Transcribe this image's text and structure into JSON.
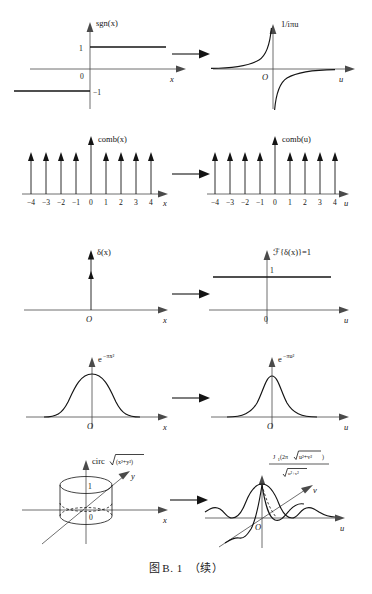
{
  "figure": {
    "caption_prefix": "图",
    "caption_number": "B. 1",
    "caption_suffix": "（续）",
    "caption_full": "图 B. 1 （续）",
    "transform_arrow": "→",
    "ink_color": "#141414",
    "axis_color": "#4a4a4a",
    "background": "#ffffff"
  },
  "rows": [
    {
      "id": "sgn",
      "left": {
        "function_label": "sgn(x)",
        "axis_x": "x",
        "origin_label": "0",
        "value_top": "1",
        "value_bottom": "−1",
        "description": "signum step function"
      },
      "right": {
        "function_label": "1/iπu",
        "axis_x": "u",
        "origin_label": "O",
        "description": "hyperbolic odd curve"
      }
    },
    {
      "id": "comb",
      "left": {
        "function_label": "comb(x)",
        "axis_x": "x",
        "origin_label": "0",
        "ticks": [
          "−4",
          "−3",
          "−2",
          "−1",
          "0",
          "1",
          "2",
          "3",
          "4"
        ],
        "description": "impulse train"
      },
      "right": {
        "function_label": "comb(u)",
        "axis_x": "u",
        "origin_label": "0",
        "ticks": [
          "−4",
          "−3",
          "−2",
          "−1",
          "0",
          "1",
          "2",
          "3",
          "4"
        ],
        "description": "impulse train"
      }
    },
    {
      "id": "delta",
      "left": {
        "function_label": "δ(x)",
        "axis_x": "x",
        "origin_label": "O",
        "description": "Dirac delta impulse at origin"
      },
      "right": {
        "function_label": "ℱ{δ(x)}=1",
        "axis_x": "u",
        "origin_label": "0",
        "value_level": "1",
        "description": "constant unity line"
      }
    },
    {
      "id": "gaussian",
      "left": {
        "function_label": "e−πx2",
        "function_base": "e",
        "function_exponent": "−πx²",
        "axis_x": "x",
        "origin_label": "O",
        "description": "wide gaussian"
      },
      "right": {
        "function_label": "e−πu2",
        "function_base": "e",
        "function_exponent": "−πu²",
        "axis_x": "u",
        "origin_label": "O",
        "description": "narrow gaussian"
      }
    },
    {
      "id": "circ",
      "left": {
        "function_label": "circ√(x²+y²)",
        "function_prefix": "circ",
        "radicand": "(x²+y²)",
        "axis_x": "x",
        "axis_y": "y",
        "origin_label": "0",
        "height_label": "1",
        "description": "unit cylinder (circ function)"
      },
      "right": {
        "numerator": "J₁(2π√u²+v²)",
        "denominator": "√u²+v²",
        "numerator_fn": "J",
        "numerator_sub": "1",
        "numerator_arg": "(2π",
        "numerator_rad": "u²+v²",
        "numerator_close": ")",
        "denominator_rad": "u²+v²",
        "axis_x": "u",
        "axis_y": "v",
        "origin_label": "O",
        "description": "jinc / Airy profile"
      }
    }
  ]
}
